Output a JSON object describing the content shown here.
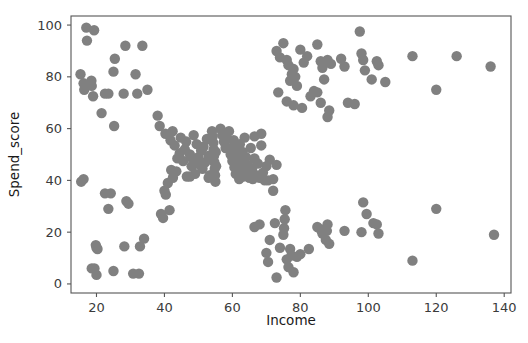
{
  "figure": {
    "background_color": "#ffffff",
    "width": 528,
    "height": 343
  },
  "chart_data": {
    "type": "scatter",
    "title": "",
    "xlabel": "Income",
    "ylabel": "Spend_score",
    "xlim": [
      12.5,
      142.0
    ],
    "ylim": [
      -3.5,
      103.5
    ],
    "xticks": [
      20,
      40,
      60,
      80,
      100,
      120,
      140
    ],
    "yticks": [
      0,
      20,
      40,
      60,
      80,
      100
    ],
    "grid": false,
    "legend": null,
    "marker": {
      "color": "#808080",
      "size": 5.2,
      "shape": "circle",
      "alpha": 1.0
    },
    "series": [
      {
        "name": "customers",
        "color": "#808080",
        "points": [
          [
            15.3,
            81.0
          ],
          [
            16.2,
            77.5
          ],
          [
            16.4,
            75.0
          ],
          [
            17.0,
            99.0
          ],
          [
            17.2,
            94.0
          ],
          [
            18.5,
            78.5
          ],
          [
            18.6,
            76.5
          ],
          [
            19.3,
            98.0
          ],
          [
            19.0,
            72.5
          ],
          [
            21.5,
            66.0
          ],
          [
            22.5,
            73.5
          ],
          [
            23.5,
            73.5
          ],
          [
            25.4,
            87.0
          ],
          [
            25.0,
            82.0
          ],
          [
            28.0,
            73.5
          ],
          [
            28.5,
            92.0
          ],
          [
            31.5,
            81.0
          ],
          [
            32.0,
            73.5
          ],
          [
            33.5,
            92.0
          ],
          [
            35.0,
            75.0
          ],
          [
            25.2,
            61.0
          ],
          [
            38.0,
            65.0
          ],
          [
            38.6,
            61.0
          ],
          [
            15.5,
            39.5
          ],
          [
            16.2,
            40.5
          ],
          [
            19.8,
            15.0
          ],
          [
            20.0,
            14.0
          ],
          [
            20.3,
            13.5
          ],
          [
            20.0,
            3.5
          ],
          [
            18.6,
            6.0
          ],
          [
            19.4,
            6.0
          ],
          [
            22.5,
            35.0
          ],
          [
            23.5,
            29.0
          ],
          [
            24.2,
            35.0
          ],
          [
            25.0,
            5.0
          ],
          [
            28.2,
            14.5
          ],
          [
            28.8,
            32.0
          ],
          [
            29.4,
            31.0
          ],
          [
            30.8,
            4.0
          ],
          [
            32.5,
            4.0
          ],
          [
            32.8,
            14.5
          ],
          [
            34.0,
            17.5
          ],
          [
            39.0,
            27.0
          ],
          [
            39.6,
            25.5
          ],
          [
            40.0,
            36.0
          ],
          [
            40.4,
            34.5
          ],
          [
            41.5,
            28.5
          ],
          [
            40.3,
            58.0
          ],
          [
            41.8,
            55.5
          ],
          [
            42.0,
            44.0
          ],
          [
            42.4,
            59.0
          ],
          [
            43.0,
            53.5
          ],
          [
            43.5,
            43.5
          ],
          [
            43.8,
            48.5
          ],
          [
            44.5,
            50.5
          ],
          [
            44.8,
            56.5
          ],
          [
            45.5,
            47.5
          ],
          [
            46.0,
            52.0
          ],
          [
            46.4,
            55.0
          ],
          [
            46.6,
            41.5
          ],
          [
            47.5,
            50.0
          ],
          [
            48.0,
            45.5
          ],
          [
            48.4,
            48.0
          ],
          [
            48.6,
            57.5
          ],
          [
            49.0,
            42.5
          ],
          [
            49.5,
            54.0
          ],
          [
            50.0,
            49.0
          ],
          [
            50.4,
            46.0
          ],
          [
            50.8,
            51.5
          ],
          [
            51.2,
            44.5
          ],
          [
            51.5,
            53.0
          ],
          [
            52.0,
            47.0
          ],
          [
            52.5,
            56.0
          ],
          [
            53.0,
            49.5
          ],
          [
            53.4,
            42.0
          ],
          [
            54.0,
            59.0
          ],
          [
            54.2,
            57.0
          ],
          [
            54.4,
            54.5
          ],
          [
            54.5,
            52.0
          ],
          [
            54.6,
            49.5
          ],
          [
            54.7,
            47.0
          ],
          [
            54.8,
            44.5
          ],
          [
            54.9,
            42.0
          ],
          [
            55.0,
            39.5
          ],
          [
            55.1,
            51.0
          ],
          [
            55.2,
            45.5
          ],
          [
            56.5,
            60.0
          ],
          [
            57.0,
            57.5
          ],
          [
            57.5,
            55.0
          ],
          [
            58.0,
            52.5
          ],
          [
            58.4,
            56.0
          ],
          [
            59.0,
            59.0
          ],
          [
            59.5,
            50.0
          ],
          [
            60.0,
            47.5
          ],
          [
            60.2,
            53.0
          ],
          [
            60.4,
            55.5
          ],
          [
            60.6,
            45.0
          ],
          [
            60.8,
            50.5
          ],
          [
            61.0,
            42.5
          ],
          [
            61.2,
            48.0
          ],
          [
            61.4,
            44.0
          ],
          [
            61.6,
            52.0
          ],
          [
            61.8,
            46.5
          ],
          [
            62.0,
            40.5
          ],
          [
            62.2,
            54.0
          ],
          [
            62.4,
            49.0
          ],
          [
            62.6,
            43.0
          ],
          [
            62.8,
            47.0
          ],
          [
            63.0,
            51.0
          ],
          [
            63.2,
            41.5
          ],
          [
            63.4,
            45.5
          ],
          [
            63.6,
            56.5
          ],
          [
            64.0,
            49.0
          ],
          [
            64.4,
            43.5
          ],
          [
            64.6,
            46.0
          ],
          [
            65.0,
            41.0
          ],
          [
            65.4,
            52.5
          ],
          [
            65.8,
            44.5
          ],
          [
            66.0,
            40.5
          ],
          [
            66.5,
            48.5
          ],
          [
            67.0,
            42.0
          ],
          [
            67.5,
            46.5
          ],
          [
            68.0,
            41.0
          ],
          [
            68.5,
            53.5
          ],
          [
            69.0,
            43.0
          ],
          [
            69.5,
            40.0
          ],
          [
            70.0,
            45.5
          ],
          [
            71.0,
            48.0
          ],
          [
            72.0,
            40.5
          ],
          [
            73.0,
            46.0
          ],
          [
            41.0,
            39.0
          ],
          [
            42.5,
            41.0
          ],
          [
            47.5,
            41.5
          ],
          [
            53.0,
            41.0
          ],
          [
            66.5,
            57.0
          ],
          [
            68.5,
            58.0
          ],
          [
            70.5,
            40.0
          ],
          [
            72.0,
            36.0
          ],
          [
            66.5,
            22.0
          ],
          [
            68.0,
            23.0
          ],
          [
            70.0,
            12.0
          ],
          [
            70.5,
            8.5
          ],
          [
            71.0,
            17.0
          ],
          [
            72.5,
            23.5
          ],
          [
            73.0,
            2.5
          ],
          [
            74.0,
            14.0
          ],
          [
            75.0,
            19.0
          ],
          [
            75.2,
            21.5
          ],
          [
            75.4,
            25.0
          ],
          [
            75.6,
            28.5
          ],
          [
            76.0,
            9.5
          ],
          [
            76.5,
            6.5
          ],
          [
            77.0,
            13.5
          ],
          [
            77.4,
            11.0
          ],
          [
            78.0,
            4.5
          ],
          [
            79.0,
            10.5
          ],
          [
            80.0,
            11.5
          ],
          [
            82.5,
            13.5
          ],
          [
            85.0,
            22.0
          ],
          [
            86.0,
            21.0
          ],
          [
            86.5,
            19.5
          ],
          [
            87.5,
            17.0
          ],
          [
            87.8,
            20.5
          ],
          [
            88.0,
            23.0
          ],
          [
            88.5,
            15.5
          ],
          [
            93.0,
            20.5
          ],
          [
            98.0,
            20.0
          ],
          [
            98.5,
            31.5
          ],
          [
            99.5,
            27.0
          ],
          [
            101.5,
            23.5
          ],
          [
            102.5,
            23.0
          ],
          [
            103.0,
            19.5
          ],
          [
            113.0,
            9.0
          ],
          [
            120.0,
            29.0
          ],
          [
            137.0,
            19.0
          ],
          [
            73.0,
            90.0
          ],
          [
            74.0,
            87.5
          ],
          [
            75.0,
            93.0
          ],
          [
            76.0,
            86.5
          ],
          [
            76.5,
            84.5
          ],
          [
            77.0,
            78.5
          ],
          [
            77.5,
            81.0
          ],
          [
            78.0,
            83.0
          ],
          [
            78.5,
            80.0
          ],
          [
            79.0,
            76.5
          ],
          [
            80.0,
            90.5
          ],
          [
            81.0,
            85.5
          ],
          [
            82.0,
            88.0
          ],
          [
            83.0,
            72.5
          ],
          [
            85.0,
            92.5
          ],
          [
            86.0,
            86.0
          ],
          [
            86.5,
            83.5
          ],
          [
            87.0,
            79.0
          ],
          [
            88.0,
            86.5
          ],
          [
            89.0,
            85.0
          ],
          [
            92.0,
            87.0
          ],
          [
            93.0,
            84.0
          ],
          [
            97.5,
            97.5
          ],
          [
            98.0,
            89.0
          ],
          [
            98.5,
            86.5
          ],
          [
            99.0,
            82.5
          ],
          [
            101.0,
            79.0
          ],
          [
            102.5,
            86.0
          ],
          [
            103.0,
            84.5
          ],
          [
            105.0,
            78.0
          ],
          [
            113.0,
            88.0
          ],
          [
            120.0,
            75.0
          ],
          [
            126.0,
            88.0
          ],
          [
            136.0,
            84.0
          ],
          [
            73.5,
            74.0
          ],
          [
            76.0,
            70.5
          ],
          [
            78.0,
            69.0
          ],
          [
            80.5,
            68.0
          ],
          [
            84.0,
            74.5
          ],
          [
            85.0,
            74.0
          ],
          [
            86.0,
            70.0
          ],
          [
            88.0,
            64.5
          ],
          [
            88.5,
            67.0
          ],
          [
            94.0,
            70.0
          ],
          [
            96.0,
            69.5
          ]
        ]
      }
    ]
  },
  "axes": {
    "x_tick_labels": [
      "20",
      "40",
      "60",
      "80",
      "100",
      "120",
      "140"
    ],
    "y_tick_labels": [
      "0",
      "20",
      "40",
      "60",
      "80",
      "100"
    ],
    "x_axis_title": "Income",
    "y_axis_title": "Spend_score",
    "spine_color": "#555555",
    "tick_label_color": "#3b3b3b"
  }
}
